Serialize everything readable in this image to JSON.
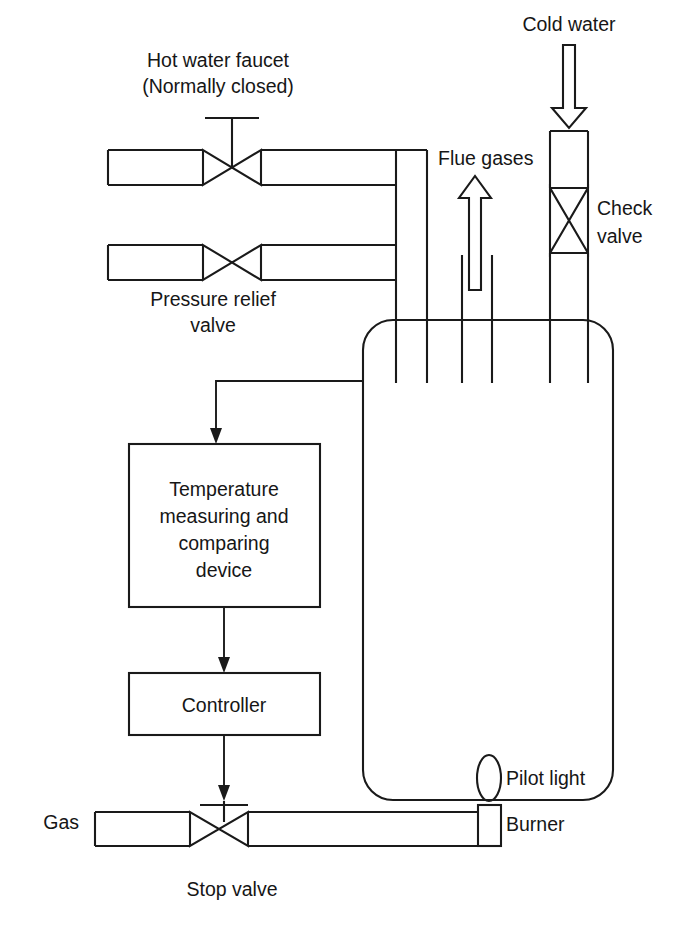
{
  "diagram": {
    "colors": {
      "line": "#1a1a1a",
      "text": "#161616",
      "background": "#ffffff"
    },
    "labels": {
      "hot_water_faucet_line1": "Hot water faucet",
      "hot_water_faucet_line2": "(Normally closed)",
      "cold_water": "Cold water",
      "flue_gases": "Flue gases",
      "check_valve_line1": "Check",
      "check_valve_line2": "valve",
      "pressure_relief_line1": "Pressure relief",
      "pressure_relief_line2": "valve",
      "temperature_device_line1": "Temperature",
      "temperature_device_line2": "measuring and",
      "temperature_device_line3": "comparing",
      "temperature_device_line4": "device",
      "controller": "Controller",
      "gas": "Gas",
      "stop_valve": "Stop valve",
      "pilot_light": "Pilot light",
      "burner": "Burner"
    },
    "components": [
      {
        "name": "hot-water-faucet",
        "type": "globe-valve",
        "label": "Hot water faucet (Normally closed)"
      },
      {
        "name": "pressure-relief-valve",
        "type": "valve",
        "label": "Pressure relief valve"
      },
      {
        "name": "check-valve",
        "type": "check-valve",
        "label": "Check valve"
      },
      {
        "name": "water-tank",
        "type": "vessel",
        "label": ""
      },
      {
        "name": "flue-stack",
        "type": "flue",
        "label": "Flue gases"
      },
      {
        "name": "temperature-measuring-and-comparing-device",
        "type": "block",
        "label": "Temperature measuring and comparing device"
      },
      {
        "name": "controller",
        "type": "block",
        "label": "Controller"
      },
      {
        "name": "stop-valve",
        "type": "globe-valve",
        "label": "Stop valve"
      },
      {
        "name": "burner",
        "type": "burner",
        "label": "Burner"
      },
      {
        "name": "pilot-light",
        "type": "pilot",
        "label": "Pilot light"
      },
      {
        "name": "gas-supply",
        "type": "pipe",
        "label": "Gas"
      },
      {
        "name": "cold-water-inlet",
        "type": "pipe",
        "label": "Cold water"
      }
    ],
    "signal_flow": [
      "water-tank -> temperature-measuring-and-comparing-device",
      "temperature-measuring-and-comparing-device -> controller",
      "controller -> stop-valve"
    ]
  }
}
